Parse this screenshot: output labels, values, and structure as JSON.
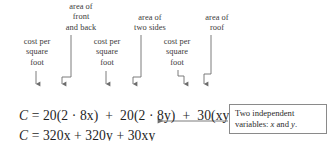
{
  "figure": {
    "name": "cost-function-annotated-equation",
    "background_color": "#ffffff",
    "text_color": "#2b2b2b",
    "rule_color": "#8a8a8a"
  },
  "annotations": {
    "area_front_back": {
      "line1": "area of",
      "line2": "front",
      "line3": "and back"
    },
    "area_two_sides": {
      "line1": "area of",
      "line2": "two sides"
    },
    "area_roof": {
      "line1": "area of",
      "line2": "roof"
    },
    "cost_per_sqft_1": {
      "line1": "cost per",
      "line2": "square",
      "line3": "foot"
    },
    "cost_per_sqft_2": {
      "line1": "cost per",
      "line2": "square",
      "line3": "foot"
    },
    "cost_per_sqft_3": {
      "line1": "cost per",
      "line2": "square",
      "line3": "foot"
    }
  },
  "equations": {
    "line1": {
      "lhs": "C",
      "eq": "=",
      "term1": "20(2 · 8x)",
      "plus1": "+",
      "term2": "20(2 · 8y)",
      "plus2": "+",
      "term3": "30(xy)",
      "full": "C = 20(2 · 8x)  +  20(2 · 8y)  +  30(xy)"
    },
    "line2": {
      "lhs": "C",
      "eq": "=",
      "term1": "320x",
      "plus1": "+",
      "term2": "320y",
      "plus2": "+",
      "term3": "30xy",
      "full": "C = 320x + 320y + 30xy"
    }
  },
  "callout": {
    "line1": "Two independent",
    "line2_prefix": "variables: ",
    "line2_var1": "x",
    "line2_mid": " and ",
    "line2_var2": "y",
    "line2_suffix": "."
  },
  "connectors": {
    "cost_arrow_1": "straight-down-arrow",
    "cost_arrow_2": "straight-down-arrow",
    "cost_arrow_3": "elbow-down-right-down-arrow",
    "area_arrow_1": "elbow-down-right-down-arrow",
    "area_arrow_2": "elbow-down-right-down-arrow",
    "area_arrow_3": "elbow-down-right-down-arrow",
    "callout_arrow": "leftward-horizontal-arrow"
  }
}
